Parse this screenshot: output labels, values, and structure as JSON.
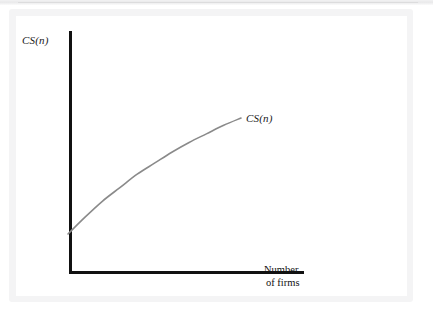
{
  "figure": {
    "y_axis_label": "CS(n)",
    "curve_label": "CS(n)",
    "x_axis_label_line1": "Number",
    "x_axis_label_line2": "of firms",
    "axis_color": "#111111",
    "curve_color": "#8a8a8a",
    "background_color": "#ffffff",
    "frame_color": "#f4f4f5"
  },
  "chart_data": {
    "type": "line",
    "title": "",
    "subtitle": "",
    "xlabel": "Number of firms",
    "ylabel": "CS(n)",
    "grid": false,
    "legend": null,
    "axis_ticks": {
      "x": [],
      "y": []
    },
    "xlim": [
      0,
      1
    ],
    "ylim": [
      0,
      1
    ],
    "annotations": [
      {
        "text": "CS(n)",
        "x": 0.75,
        "y": 0.64,
        "description": "curve label at right end of the consumer surplus curve"
      }
    ],
    "series": [
      {
        "name": "CS(n)",
        "color": "#8a8a8a",
        "description": "Consumer surplus increases with the number of firms at a decreasing rate (concave, increasing).",
        "x": [
          0.0,
          0.1,
          0.2,
          0.3,
          0.4,
          0.5,
          0.6,
          0.7,
          0.8,
          0.9,
          1.0
        ],
        "y": [
          0.0,
          0.14,
          0.27,
          0.38,
          0.49,
          0.58,
          0.67,
          0.75,
          0.82,
          0.89,
          0.95
        ]
      }
    ]
  }
}
